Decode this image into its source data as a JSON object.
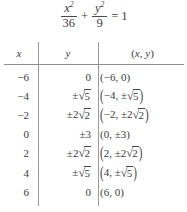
{
  "equation": {
    "numerator_x": "x",
    "exponent": "2",
    "denominator_x": "36",
    "plus": "+",
    "numerator_y": "y",
    "denominator_y": "9",
    "equals": "=",
    "rhs": "1",
    "plain": "x^2/36 + y^2/9 = 1"
  },
  "table": {
    "headers": {
      "x": "x",
      "y": "y",
      "point_open": "(",
      "point_x": "x",
      "point_comma": ",",
      "point_y": "y",
      "point_close": ")",
      "point_plain": "(x, y)"
    },
    "rows": [
      {
        "x": "−6",
        "y_plain": "0",
        "y_kind": "plain",
        "y_sign": "",
        "y_coef": "",
        "y_radicand": "",
        "point_plain": "(−6, 0)",
        "point_paren": "small",
        "point_x": "−6",
        "point_y_sign": "",
        "point_y_coef": "",
        "point_y_radicand": "",
        "point_y_plain": "0"
      },
      {
        "x": "−4",
        "y_plain": "±√5",
        "y_kind": "radical",
        "y_sign": "±",
        "y_coef": "",
        "y_radicand": "5",
        "point_plain": "(−4, ±√5)",
        "point_paren": "big",
        "point_x": "−4",
        "point_y_sign": "±",
        "point_y_coef": "",
        "point_y_radicand": "5",
        "point_y_plain": ""
      },
      {
        "x": "−2",
        "y_plain": "±2√2",
        "y_kind": "radical",
        "y_sign": "±",
        "y_coef": "2",
        "y_radicand": "2",
        "point_plain": "(−2, ±2√2)",
        "point_paren": "big",
        "point_x": "−2",
        "point_y_sign": "±",
        "point_y_coef": "2",
        "point_y_radicand": "2",
        "point_y_plain": ""
      },
      {
        "x": "0",
        "y_plain": "±3",
        "y_kind": "plain",
        "y_sign": "",
        "y_coef": "",
        "y_radicand": "",
        "point_plain": "(0, ±3)",
        "point_paren": "small",
        "point_x": "0",
        "point_y_sign": "",
        "point_y_coef": "",
        "point_y_radicand": "",
        "point_y_plain": "±3"
      },
      {
        "x": "2",
        "y_plain": "±2√2",
        "y_kind": "radical",
        "y_sign": "±",
        "y_coef": "2",
        "y_radicand": "2",
        "point_plain": "(2, ±2√2)",
        "point_paren": "big",
        "point_x": "2",
        "point_y_sign": "±",
        "point_y_coef": "2",
        "point_y_radicand": "2",
        "point_y_plain": ""
      },
      {
        "x": "4",
        "y_plain": "±√5",
        "y_kind": "radical",
        "y_sign": "±",
        "y_coef": "",
        "y_radicand": "5",
        "point_plain": "(4, ±√5)",
        "point_paren": "big",
        "point_x": "4",
        "point_y_sign": "±",
        "point_y_coef": "",
        "point_y_radicand": "5",
        "point_y_plain": ""
      },
      {
        "x": "6",
        "y_plain": "0",
        "y_kind": "plain",
        "y_sign": "",
        "y_coef": "",
        "y_radicand": "",
        "point_plain": "(6, 0)",
        "point_paren": "small",
        "point_x": "6",
        "point_y_sign": "",
        "point_y_coef": "",
        "point_y_radicand": "",
        "point_y_plain": "0"
      }
    ]
  },
  "style": {
    "text_color": "#3a3a3a",
    "rule_color": "#8f8f8f",
    "background": "#ffffff"
  }
}
